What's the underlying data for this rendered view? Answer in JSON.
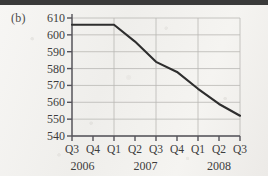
{
  "panel": {
    "label": "(b)"
  },
  "colors": {
    "line": "#2e2e2e",
    "axis": "#55535a",
    "grid": "#b9b7b4",
    "text": "#3d3d3d",
    "paper": "#f3f2f0",
    "top_bar": "#3a3a3a"
  },
  "chart_data": {
    "type": "line",
    "title": "",
    "xlabel": "",
    "ylabel": "",
    "grid": true,
    "legend": "none",
    "ylim": [
      540,
      610
    ],
    "ytick_labels": [
      "610",
      "600",
      "590",
      "580",
      "570",
      "560",
      "550",
      "540"
    ],
    "ytick_values": [
      610,
      600,
      590,
      580,
      570,
      560,
      550,
      540
    ],
    "categories": [
      "Q3",
      "Q4",
      "Q1",
      "Q2",
      "Q3",
      "Q4",
      "Q1",
      "Q2",
      "Q3"
    ],
    "year_groups": [
      {
        "label": "2006",
        "start_index": 0,
        "end_index": 1
      },
      {
        "label": "2007",
        "start_index": 2,
        "end_index": 5
      },
      {
        "label": "2008",
        "start_index": 6,
        "end_index": 8
      }
    ],
    "values": [
      606,
      606,
      606,
      596,
      584,
      578,
      568,
      559,
      552
    ],
    "gridline_indices": [
      0,
      2,
      4,
      6,
      8
    ]
  }
}
